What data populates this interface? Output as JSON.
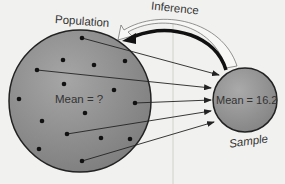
{
  "diagram": {
    "population": {
      "label": "Population",
      "mean_label": "Mean = ?"
    },
    "sample": {
      "label": "Sample",
      "mean_label": "Mean = 16.2"
    },
    "inference_label": "Inference",
    "colors": {
      "background": "#f1f1ef",
      "circle_fill": "#8f8f8f",
      "circle_stroke": "#222222",
      "dot": "#111111",
      "arrow": "#222222"
    },
    "population_dot_count": 16,
    "sampled_arrow_count": 5
  }
}
